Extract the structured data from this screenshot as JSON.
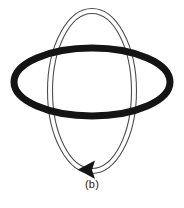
{
  "figure": {
    "caption": "(b)",
    "background_color": "#ffffff",
    "canvas": {
      "width": 184,
      "height": 208
    },
    "elements": {
      "horizontal_ring": {
        "label": "horizontal-ring",
        "shape": "ellipse",
        "center_x": 92,
        "center_y": 82,
        "radius_x": 78,
        "radius_y": 34,
        "stroke_color": "#141414",
        "stroke_width": 7,
        "fill": "none",
        "z_order": "front"
      },
      "vertical_ring": {
        "label": "vertical-ring",
        "shape": "ellipse",
        "center_x": 92,
        "center_y": 91,
        "radius_x": 42,
        "radius_y": 80,
        "stroke_color": "#4d4d4d",
        "stroke_width": 1,
        "tube_width": 5,
        "fill": "#ffffff",
        "z_order": "back"
      },
      "direction_arrow": {
        "label": "direction-arrowhead",
        "shape": "triangle",
        "direction": "left",
        "tip_x": 78,
        "tip_y": 169,
        "width": 17,
        "height": 18,
        "fill_color": "#141414"
      }
    }
  }
}
